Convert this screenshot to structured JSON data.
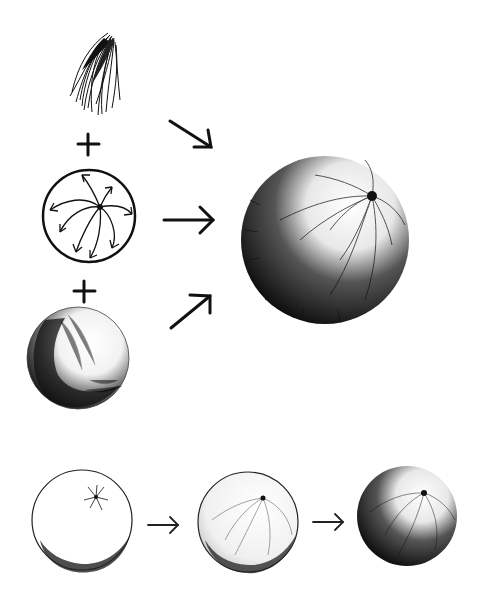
{
  "illustration": {
    "subject": "Drawing a fuzzy ball: stroke + direction + shading = furry sphere",
    "colors": {
      "background": "#ffffff",
      "ink": "#1a1a1a",
      "shade": "#111111"
    },
    "top_section": {
      "elements": [
        {
          "name": "stroke-sample",
          "description": "hatched fur stroke tuft"
        },
        {
          "name": "plus-sign",
          "glyph": "+"
        },
        {
          "name": "direction-diagram",
          "description": "circle with curved arrows radiating from a center point"
        },
        {
          "name": "plus-sign",
          "glyph": "+"
        },
        {
          "name": "shaded-sphere",
          "description": "sphere with shadow on lower-left"
        }
      ],
      "arrows": [
        "↘",
        "→",
        "↗"
      ],
      "result": "furry ball"
    },
    "bottom_section": {
      "steps": [
        {
          "name": "step-1",
          "description": "outline fur with center whorl"
        },
        {
          "name": "step-2",
          "description": "light directional strokes"
        },
        {
          "name": "step-3",
          "description": "fully shaded furry ball"
        }
      ],
      "arrows": [
        "→",
        "→"
      ]
    }
  }
}
